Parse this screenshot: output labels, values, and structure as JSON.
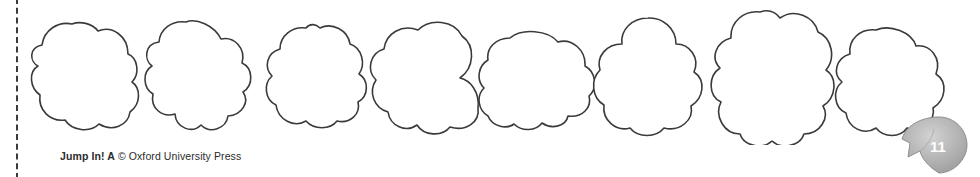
{
  "page": {
    "width": 980,
    "height": 177,
    "background_color": "#ffffff"
  },
  "cut_line": {
    "name": "dashed-cut-line",
    "orientation": "vertical",
    "color": "#3b3b3b",
    "style": "dashed"
  },
  "worksheet": {
    "shape_name": "cloud",
    "shape_count": 8,
    "outline_color": "#3a3a3a",
    "fill_color": "#ffffff",
    "shapes": [
      {
        "label": "cloud-1"
      },
      {
        "label": "cloud-2"
      },
      {
        "label": "cloud-3"
      },
      {
        "label": "cloud-4"
      },
      {
        "label": "cloud-5"
      },
      {
        "label": "cloud-6"
      },
      {
        "label": "cloud-7"
      },
      {
        "label": "cloud-8"
      }
    ]
  },
  "footer": {
    "title": "Jump In! A",
    "copyright": "© Oxford University Press"
  },
  "page_badge": {
    "number": "11",
    "fill_color": "#a8a8a8",
    "text_color": "#ffffff"
  }
}
